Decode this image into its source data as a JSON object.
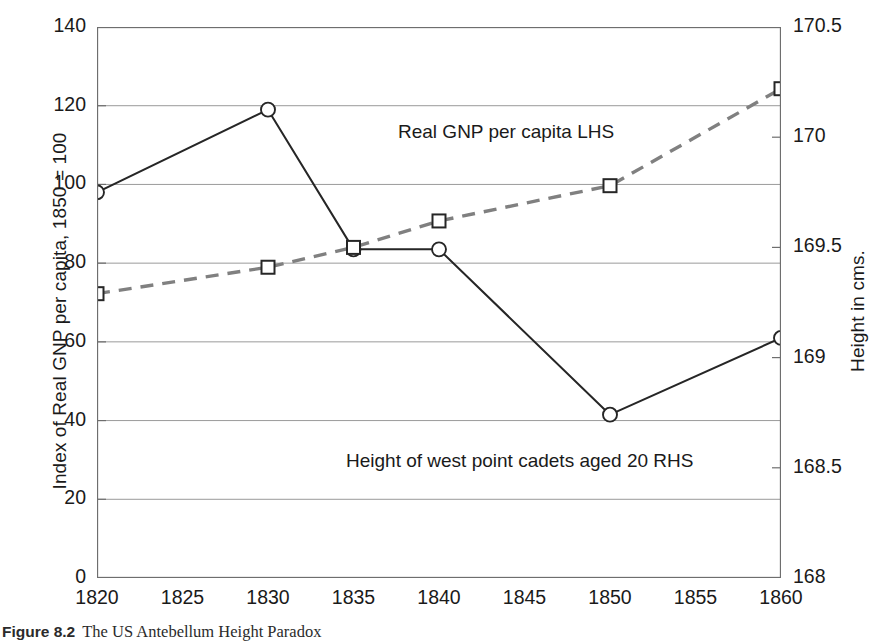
{
  "chart_data": {
    "type": "line",
    "title": "",
    "x": [
      1820,
      1830,
      1835,
      1840,
      1850,
      1860
    ],
    "xlabel": "",
    "xlim": [
      1820,
      1860
    ],
    "xticks": [
      1820,
      1825,
      1830,
      1835,
      1840,
      1845,
      1850,
      1855,
      1860
    ],
    "grid": true,
    "legend_position": "inline-annotations",
    "axes": [
      {
        "side": "left",
        "label": "Index of Real GNP per capita, 1850 = 100",
        "ylim": [
          0,
          140
        ],
        "yticks": [
          0,
          20,
          40,
          60,
          80,
          100,
          120,
          140
        ]
      },
      {
        "side": "right",
        "label": "Height in cms.",
        "ylim": [
          168,
          170.5
        ],
        "yticks": [
          168,
          168.5,
          169,
          169.5,
          170,
          170.5
        ]
      }
    ],
    "series": [
      {
        "name": "Real GNP per capita LHS",
        "axis": "left",
        "marker": "circle",
        "line_style": "solid",
        "color": "#262626",
        "x": [
          1820,
          1830,
          1835,
          1840,
          1850,
          1860
        ],
        "values": [
          98,
          119,
          83.5,
          83.5,
          41.5,
          61
        ]
      },
      {
        "name": "Height of west point cadets aged 20 RHS",
        "axis": "right",
        "marker": "square",
        "line_style": "dashed",
        "color": "#808080",
        "x": [
          1820,
          1830,
          1835,
          1840,
          1850,
          1860
        ],
        "values": [
          169.29,
          169.41,
          169.5,
          169.62,
          169.78,
          170.22
        ]
      }
    ],
    "annotations": [
      {
        "text": "Real GNP per capita LHS",
        "x": 1843,
        "y": 110
      },
      {
        "text": "Height of west point cadets aged 20 RHS",
        "x": 1841,
        "y": 30
      }
    ]
  },
  "caption": {
    "number": "Figure 8.2",
    "text": "The US Antebellum Height Paradox"
  }
}
